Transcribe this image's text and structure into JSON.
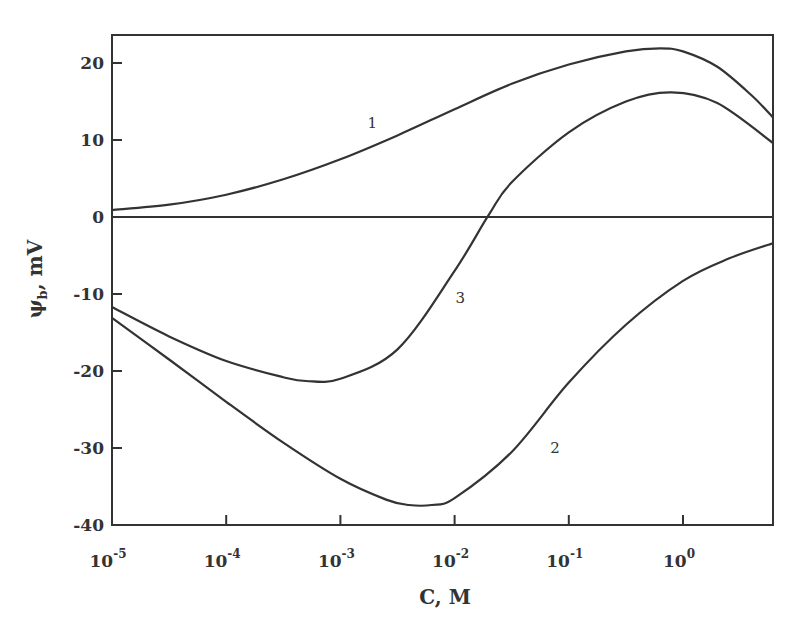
{
  "chart_data": {
    "type": "line",
    "title": "",
    "xlabel": "C, M",
    "ylabel": "ψb, mV",
    "ylabel_main": "ψ",
    "ylabel_sub": "b",
    "ylabel_unit": ", mV",
    "xscale": "log",
    "xlim_log10": [
      -5,
      0.79
    ],
    "ylim": [
      -40,
      24
    ],
    "grid": false,
    "legend": "none (curves labeled inline 1, 2, 3)",
    "x_ticks": [
      {
        "log": -5,
        "base": "10",
        "exp": "-5"
      },
      {
        "log": -4,
        "base": "10",
        "exp": "-4"
      },
      {
        "log": -3,
        "base": "10",
        "exp": "-3"
      },
      {
        "log": -2,
        "base": "10",
        "exp": "-2"
      },
      {
        "log": -1,
        "base": "10",
        "exp": "-1"
      },
      {
        "log": 0,
        "base": "10",
        "exp": "0"
      }
    ],
    "y_ticks": [
      20,
      10,
      0,
      -10,
      -20,
      -30,
      -40
    ],
    "y_tick_labels": [
      "20",
      "10",
      "0",
      "-10",
      "-20",
      "-30",
      "-40"
    ],
    "zero_line": true,
    "series": [
      {
        "name": "1",
        "label_pos": {
          "log": -2.72,
          "mV": 11.6
        },
        "x_log10": [
          -5,
          -4.5,
          -4,
          -3.5,
          -3,
          -2.5,
          -2,
          -1.5,
          -1,
          -0.5,
          -0.2,
          0.0,
          0.3,
          0.6,
          0.79
        ],
        "values": [
          0.9,
          1.6,
          2.9,
          4.9,
          7.5,
          10.6,
          14.0,
          17.3,
          19.8,
          21.5,
          21.9,
          21.5,
          19.5,
          15.8,
          12.9
        ]
      },
      {
        "name": "2",
        "label_pos": {
          "log": -1.12,
          "mV": -30.6
        },
        "x_log10": [
          -5,
          -4.5,
          -4,
          -3.5,
          -3,
          -2.6,
          -2.4,
          -2.2,
          -2,
          -1.5,
          -1,
          -0.5,
          0,
          0.4,
          0.79
        ],
        "values": [
          -13.1,
          -18.5,
          -24.0,
          -29.3,
          -34.0,
          -36.7,
          -37.4,
          -37.4,
          -36.5,
          -30.5,
          -21.5,
          -14.0,
          -8.3,
          -5.4,
          -3.4
        ]
      },
      {
        "name": "3",
        "label_pos": {
          "log": -1.95,
          "mV": -11.2
        },
        "x_log10": [
          -5,
          -4.5,
          -4,
          -3.5,
          -3.3,
          -3,
          -2.5,
          -2,
          -1.7,
          -1.5,
          -1,
          -0.5,
          -0.1,
          0.3,
          0.79
        ],
        "values": [
          -11.7,
          -15.5,
          -18.7,
          -20.8,
          -21.3,
          -21.0,
          -17.2,
          -7.0,
          0.3,
          4.5,
          11.0,
          15.0,
          16.2,
          14.8,
          9.6
        ]
      }
    ]
  }
}
